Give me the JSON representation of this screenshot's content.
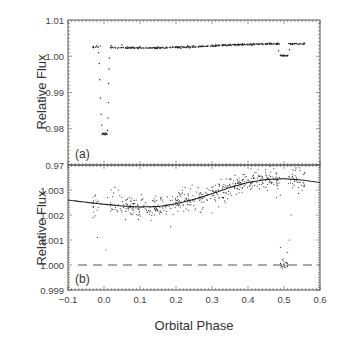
{
  "chart_data": [
    {
      "panel": "a",
      "type": "scatter",
      "panel_label": "(a)",
      "xlabel": "",
      "ylabel": "Relative Flux",
      "xlim": [
        -0.1,
        0.6
      ],
      "ylim": [
        0.97,
        1.01
      ],
      "yticks": [
        "0.97",
        "0.98",
        "0.99",
        "1.00",
        "1.01"
      ],
      "ytick_values": [
        0.97,
        0.98,
        0.99,
        1.0,
        1.01
      ],
      "xticks": [],
      "grid": false,
      "description": "Light curve with primary transit at phase 0.0 (depth to ~0.9785) and secondary eclipse at phase ~0.5 (depth ~0.0025)",
      "series": [
        {
          "name": "baseline",
          "points": [
            [
              -0.03,
              1.0027
            ],
            [
              -0.02,
              1.0029
            ],
            [
              -0.01,
              1.0028
            ],
            [
              0.02,
              1.003
            ],
            [
              0.05,
              1.0031
            ],
            [
              0.1,
              1.0027
            ],
            [
              0.15,
              1.0026
            ],
            [
              0.2,
              1.0027
            ],
            [
              0.25,
              1.0029
            ],
            [
              0.3,
              1.0031
            ],
            [
              0.35,
              1.0033
            ],
            [
              0.4,
              1.0034
            ],
            [
              0.45,
              1.0035
            ],
            [
              0.48,
              1.0034
            ],
            [
              0.52,
              1.0034
            ],
            [
              0.55,
              1.0033
            ]
          ]
        },
        {
          "name": "primary-transit",
          "points": [
            [
              -0.015,
              1.001
            ],
            [
              -0.013,
              0.998
            ],
            [
              -0.012,
              0.9935
            ],
            [
              -0.01,
              0.9885
            ],
            [
              -0.008,
              0.984
            ],
            [
              -0.006,
              0.981
            ],
            [
              -0.004,
              0.9788
            ],
            [
              -0.002,
              0.9786
            ],
            [
              0.0,
              0.9784
            ],
            [
              0.002,
              0.9786
            ],
            [
              0.004,
              0.9789
            ],
            [
              0.01,
              0.9795
            ],
            [
              0.011,
              0.983
            ],
            [
              0.012,
              0.9872
            ],
            [
              0.013,
              0.9925
            ],
            [
              0.014,
              0.9965
            ],
            [
              0.015,
              0.9995
            ]
          ]
        },
        {
          "name": "secondary-eclipse",
          "points": [
            [
              0.485,
              1.0015
            ],
            [
              0.49,
              1.0002
            ],
            [
              0.495,
              1.0001
            ],
            [
              0.5,
              1.0
            ],
            [
              0.505,
              1.0001
            ],
            [
              0.51,
              1.0002
            ],
            [
              0.515,
              1.0018
            ]
          ]
        }
      ]
    },
    {
      "panel": "b",
      "type": "scatter",
      "panel_label": "(b)",
      "xlabel": "Orbital Phase",
      "ylabel": "Relative Flux",
      "xlim": [
        -0.1,
        0.6
      ],
      "ylim": [
        0.999,
        1.004
      ],
      "xticks": [
        "-0.1",
        "0.0",
        "0.1",
        "0.2",
        "0.3",
        "0.4",
        "0.5",
        "0.6"
      ],
      "xtick_values": [
        -0.1,
        0.0,
        0.1,
        0.2,
        0.3,
        0.4,
        0.5,
        0.6
      ],
      "yticks": [
        "0.999",
        "1.000",
        "1.001",
        "1.002",
        "1.003"
      ],
      "ytick_values": [
        0.999,
        1.0,
        1.001,
        1.002,
        1.003
      ],
      "grid": false,
      "reference_line": {
        "y": 1.0,
        "style": "dashed"
      },
      "model_curve": {
        "name": "phase-curve-fit",
        "x": [
          -0.1,
          -0.05,
          0.0,
          0.05,
          0.1,
          0.15,
          0.2,
          0.25,
          0.3,
          0.35,
          0.4,
          0.45,
          0.5,
          0.55,
          0.6
        ],
        "y": [
          1.0026,
          1.00251,
          1.00243,
          1.00236,
          1.00232,
          1.00234,
          1.00245,
          1.00263,
          1.00285,
          1.0031,
          1.0033,
          1.00342,
          1.00345,
          1.0034,
          1.0033
        ]
      },
      "series": [
        {
          "name": "data",
          "points": [
            [
              -0.03,
              1.0019
            ],
            [
              -0.03,
              1.0023
            ],
            [
              -0.025,
              1.0028
            ],
            [
              -0.022,
              1.0026
            ],
            [
              -0.02,
              1.0025
            ],
            [
              -0.018,
              1.0011
            ],
            [
              0.005,
              1.0006
            ],
            [
              0.01,
              1.0027
            ],
            [
              0.02,
              1.003
            ],
            [
              0.03,
              1.0031
            ],
            [
              0.04,
              1.003
            ],
            [
              0.05,
              1.0027
            ],
            [
              0.06,
              1.0026
            ],
            [
              0.08,
              1.0022
            ],
            [
              0.1,
              1.0023
            ],
            [
              0.12,
              1.0021
            ],
            [
              0.14,
              1.002
            ],
            [
              0.15,
              1.0024
            ],
            [
              0.2,
              1.0025
            ],
            [
              0.25,
              1.0026
            ],
            [
              0.3,
              1.0031
            ],
            [
              0.35,
              1.0032
            ],
            [
              0.4,
              1.0034
            ],
            [
              0.43,
              1.0036
            ],
            [
              0.45,
              1.0036
            ],
            [
              0.48,
              1.0032
            ],
            [
              0.49,
              1.0028
            ],
            [
              0.49,
              1.0007
            ],
            [
              0.495,
              1.0002
            ],
            [
              0.5,
              1.0
            ],
            [
              0.5,
              0.9999
            ],
            [
              0.505,
              1.0001
            ],
            [
              0.51,
              1.0005
            ],
            [
              0.515,
              1.001
            ],
            [
              0.52,
              1.002
            ],
            [
              0.53,
              1.0034
            ],
            [
              0.54,
              1.0031
            ],
            [
              0.55,
              1.003
            ]
          ]
        }
      ]
    }
  ],
  "noise_model": {
    "seed": 7,
    "panel_a_scatter": 0.00012,
    "panel_b_scatter": 0.00022,
    "phase_start": -0.03,
    "phase_end": 0.56,
    "gap": [
      -0.015,
      0.015
    ],
    "count": 520
  },
  "colors": {
    "points": "#222222",
    "curve": "#222222",
    "frame": "#555555",
    "dashed": "#555555"
  }
}
